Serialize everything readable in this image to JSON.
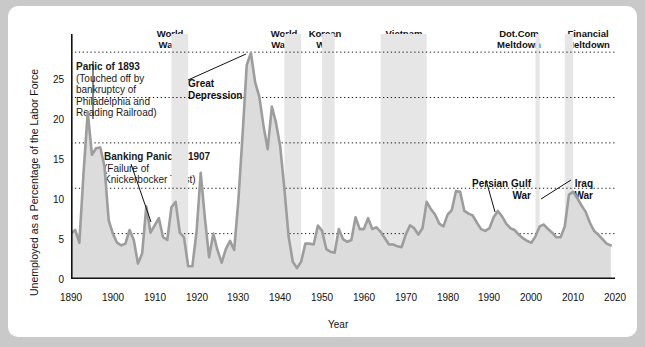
{
  "chart_data": {
    "type": "area",
    "title": "",
    "xlabel": "Year",
    "ylabel": "Unemployed as a Percentage of the Labor Force",
    "xlim": [
      1890,
      2020
    ],
    "ylim": [
      0,
      27
    ],
    "grid": "horizontal dotted at 5,10,15,20,25",
    "legend": "none",
    "series_name": "Unemployment rate",
    "line_color": "#9a9a9a",
    "fill_color": "#d9d9d9",
    "band_color": "#e6e6e6",
    "x": [
      1890,
      1891,
      1892,
      1893,
      1894,
      1895,
      1896,
      1897,
      1898,
      1899,
      1900,
      1901,
      1902,
      1903,
      1904,
      1905,
      1906,
      1907,
      1908,
      1909,
      1910,
      1911,
      1912,
      1913,
      1914,
      1915,
      1916,
      1917,
      1918,
      1919,
      1920,
      1921,
      1922,
      1923,
      1924,
      1925,
      1926,
      1927,
      1928,
      1929,
      1930,
      1931,
      1932,
      1933,
      1934,
      1935,
      1936,
      1937,
      1938,
      1939,
      1940,
      1941,
      1942,
      1943,
      1944,
      1945,
      1946,
      1947,
      1948,
      1949,
      1950,
      1951,
      1952,
      1953,
      1954,
      1955,
      1956,
      1957,
      1958,
      1959,
      1960,
      1961,
      1962,
      1963,
      1964,
      1965,
      1966,
      1967,
      1968,
      1969,
      1970,
      1971,
      1972,
      1973,
      1974,
      1975,
      1976,
      1977,
      1978,
      1979,
      1980,
      1981,
      1982,
      1983,
      1984,
      1985,
      1986,
      1987,
      1988,
      1989,
      1990,
      1991,
      1992,
      1993,
      1994,
      1995,
      1996,
      1997,
      1998,
      1999,
      2000,
      2001,
      2002,
      2003,
      2004,
      2005,
      2006,
      2007,
      2008,
      2009,
      2010,
      2011,
      2012,
      2013,
      2014,
      2015,
      2016,
      2017,
      2018,
      2019
    ],
    "values": [
      5.0,
      5.4,
      4.0,
      11.7,
      18.4,
      13.7,
      14.4,
      14.5,
      12.4,
      6.5,
      5.0,
      4.0,
      3.7,
      3.9,
      5.4,
      4.3,
      1.7,
      2.8,
      8.0,
      5.1,
      5.9,
      6.7,
      4.6,
      4.3,
      7.9,
      8.5,
      5.1,
      4.6,
      1.4,
      1.4,
      5.2,
      11.7,
      6.7,
      2.4,
      5.0,
      3.2,
      1.8,
      3.3,
      4.2,
      3.2,
      8.7,
      15.9,
      23.6,
      24.9,
      21.7,
      20.1,
      16.9,
      14.3,
      19.0,
      17.2,
      14.6,
      9.9,
      4.7,
      1.9,
      1.2,
      1.9,
      3.9,
      3.9,
      3.8,
      5.9,
      5.3,
      3.3,
      3.0,
      2.9,
      5.5,
      4.4,
      4.1,
      4.3,
      6.8,
      5.5,
      5.5,
      6.7,
      5.5,
      5.7,
      5.2,
      4.5,
      3.8,
      3.8,
      3.6,
      3.5,
      4.9,
      5.9,
      5.6,
      4.9,
      5.6,
      8.5,
      7.7,
      7.1,
      6.1,
      5.8,
      7.1,
      7.6,
      9.7,
      9.6,
      7.5,
      7.2,
      7.0,
      6.2,
      5.5,
      5.3,
      5.6,
      6.8,
      7.5,
      6.9,
      6.1,
      5.6,
      5.4,
      4.9,
      4.5,
      4.2,
      4.0,
      4.7,
      5.8,
      6.0,
      5.5,
      5.1,
      4.6,
      4.6,
      5.8,
      9.3,
      9.6,
      8.9,
      8.1,
      7.4,
      6.2,
      5.3,
      4.9,
      4.4,
      3.9,
      3.7
    ],
    "yticks": [
      0,
      5,
      10,
      15,
      20,
      25
    ],
    "xticks": [
      1890,
      1900,
      1910,
      1920,
      1930,
      1940,
      1950,
      1960,
      1970,
      1980,
      1990,
      2000,
      2010,
      2020
    ],
    "shaded_bands": [
      {
        "name": "World War I",
        "start": 1914,
        "end": 1918,
        "label": "World\nWar I",
        "label_line1": "World",
        "label_line2": "War I"
      },
      {
        "name": "World War II",
        "start": 1941,
        "end": 1945,
        "label_line1": "World",
        "label_line2": "War II"
      },
      {
        "name": "Korean War",
        "start": 1950,
        "end": 1953,
        "label_line1": "Korean",
        "label_line2": "War"
      },
      {
        "name": "Vietnam War",
        "start": 1964,
        "end": 1975,
        "label_line1": "Vietnam",
        "label_line2": "War"
      },
      {
        "name": "Dot.Com Meltdown",
        "start": 2001,
        "end": 2002,
        "label_line1": "Dot.Com",
        "label_line2": "Meltdown"
      },
      {
        "name": "Financial Meltdown",
        "start": 2008,
        "end": 2010,
        "label_line1": "Financial",
        "label_line2": "Meltdown"
      }
    ],
    "annotations": [
      {
        "id": "panic-1893",
        "title": "Panic of 1893",
        "body_lines": [
          "(Touched off by",
          "bankruptcy of",
          "Philadelphia and",
          "Reading Railroad)"
        ],
        "points_to_year": 1894
      },
      {
        "id": "banking-panic-1907",
        "title": "Banking Panic of 1907",
        "body_lines": [
          "(Failure of",
          "Knickerbocker Trust)"
        ],
        "points_to_year": 1908
      },
      {
        "id": "great-depression",
        "title_line1": "Great",
        "title_line2": "Depression",
        "points_to_year": 1933
      },
      {
        "id": "persian-gulf-war",
        "title_line1": "Persian Gulf",
        "title_line2": "War",
        "points_to_year": 1991
      },
      {
        "id": "iraq-war",
        "title_line1": "Iraq",
        "title_line2": "War",
        "points_to_year": 2003
      }
    ]
  },
  "axes": {
    "y_title": "Unemployed as a Percentage of the Labor Force",
    "x_title": "Year",
    "y_tick_labels": [
      "0",
      "5",
      "10",
      "15",
      "20",
      "25"
    ],
    "x_tick_labels": [
      "1890",
      "1900",
      "1910",
      "1920",
      "1930",
      "1940",
      "1950",
      "1960",
      "1970",
      "1980",
      "1990",
      "2000",
      "2010",
      "2020"
    ]
  },
  "bands": {
    "wwi": {
      "line1": "World",
      "line2": "War I"
    },
    "wwii": {
      "line1": "World",
      "line2": "War II"
    },
    "korea": {
      "line1": "Korean",
      "line2": "War"
    },
    "vietnam": {
      "line1": "Vietnam",
      "line2": "War"
    },
    "dotcom": {
      "line1": "Dot.Com",
      "line2": "Meltdown"
    },
    "financial": {
      "line1": "Financial",
      "line2": "Meltdown"
    }
  },
  "notes": {
    "panic1893": {
      "title": "Panic of 1893",
      "l1": "(Touched off by",
      "l2": "bankruptcy of",
      "l3": "Philadelphia and",
      "l4": "Reading Railroad)"
    },
    "banking1907": {
      "title": "Banking Panic of 1907",
      "l1": "(Failure of",
      "l2": "Knickerbocker Trust)"
    },
    "greatdepression": {
      "l1": "Great",
      "l2": "Depression"
    },
    "persiangulf": {
      "l1": "Persian Gulf",
      "l2": "War"
    },
    "iraq": {
      "l1": "Iraq",
      "l2": "War"
    }
  }
}
